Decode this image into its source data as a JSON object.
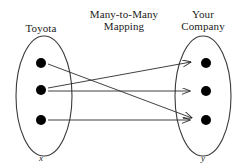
{
  "diagram": {
    "title_left": "Toyota",
    "title_center": "Many-to-Many\nMapping",
    "title_right": "Your\nCompany",
    "axis_left": "x",
    "axis_right": "y",
    "stroke_color": "#2b2b2b",
    "dot_color": "#000000",
    "background": "#ffffff",
    "left_set": {
      "name": "Toyota",
      "variable": "x",
      "ellipse": {
        "cx": 44,
        "cy": 96,
        "rx": 28,
        "ry": 60
      },
      "nodes": [
        {
          "id": "x1",
          "cx": 41,
          "cy": 63,
          "r": 5
        },
        {
          "id": "x2",
          "cx": 41,
          "cy": 90,
          "r": 5
        },
        {
          "id": "x3",
          "cx": 41,
          "cy": 120,
          "r": 5
        }
      ]
    },
    "right_set": {
      "name": "Your Company",
      "variable": "y",
      "ellipse": {
        "cx": 203,
        "cy": 96,
        "rx": 28,
        "ry": 60
      },
      "nodes": [
        {
          "id": "y1",
          "cx": 206,
          "cy": 63,
          "r": 5
        },
        {
          "id": "y2",
          "cx": 206,
          "cy": 91,
          "r": 5
        },
        {
          "id": "y3",
          "cx": 206,
          "cy": 120,
          "r": 5
        }
      ]
    },
    "edges": [
      {
        "id": "edge-x1-y3",
        "from": "x1",
        "to": "y3",
        "x1": 48,
        "y1": 64,
        "x2": 192,
        "y2": 118
      },
      {
        "id": "edge-x2-y1",
        "from": "x2",
        "to": "y1",
        "x1": 48,
        "y1": 88,
        "x2": 191,
        "y2": 62
      },
      {
        "id": "edge-x2-y2",
        "from": "x2",
        "to": "y2",
        "x1": 48,
        "y1": 91,
        "x2": 190,
        "y2": 91
      },
      {
        "id": "edge-x3-y3",
        "from": "x3",
        "to": "y3",
        "x1": 48,
        "y1": 120,
        "x2": 190,
        "y2": 120
      }
    ]
  }
}
